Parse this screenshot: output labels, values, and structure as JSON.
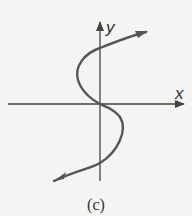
{
  "figure": {
    "caption": "(c)",
    "x_axis_label": "x",
    "y_axis_label": "y",
    "curve_description": "S-shaped curve crossing the y-axis three times, passing through the origin, with arrows at both ends",
    "colors": {
      "background": "#f4f4f2",
      "stroke": "#555555",
      "axis": "#444444",
      "text": "#333333"
    }
  }
}
